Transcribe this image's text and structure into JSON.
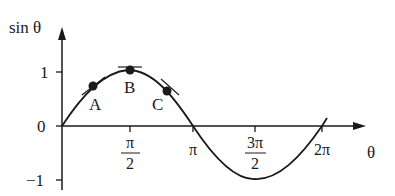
{
  "diagram": {
    "y_axis_label": "sin θ",
    "x_axis_label": "θ",
    "y_ticks": [
      {
        "label": "1",
        "value": 1
      },
      {
        "label": "0",
        "value": 0
      },
      {
        "label": "−1",
        "value": -1
      }
    ],
    "x_ticks": [
      {
        "num": "π",
        "den": "2",
        "value": "pi/2"
      },
      {
        "label": "π",
        "value": "pi"
      },
      {
        "num": "3π",
        "den": "2",
        "value": "3pi/2"
      },
      {
        "label": "2π",
        "value": "2pi"
      }
    ],
    "points": [
      {
        "label": "A",
        "theta": "≈π/4",
        "note": "tangent line drawn"
      },
      {
        "label": "B",
        "theta": "π/2",
        "note": "horizontal tangent at maximum"
      },
      {
        "label": "C",
        "theta": "≈3π/4",
        "note": "tangent line drawn"
      }
    ],
    "colors": {
      "ink": "#1a1a1a",
      "background": "#ffffff"
    }
  }
}
